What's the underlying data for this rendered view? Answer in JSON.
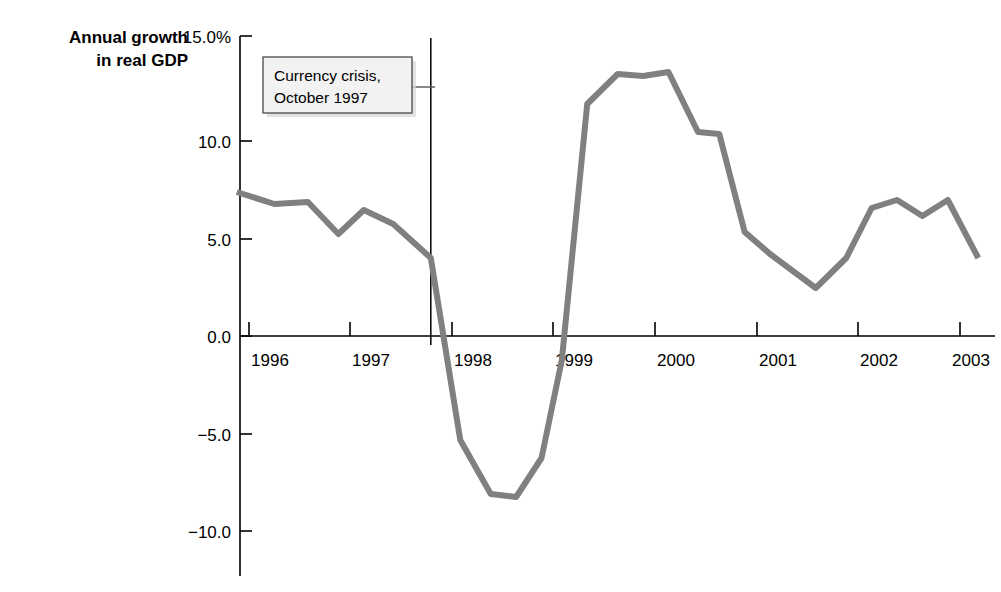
{
  "figure": {
    "axis_title": "Annual growth\nin real GDP",
    "line_color": "#808080",
    "axis_color": "#000000",
    "annotation_box_fill": "#f2f2f2",
    "annotation_box_border": "#555555",
    "background": "#ffffff"
  },
  "annotation": {
    "name": "currency-crisis-callout",
    "line1": "Currency crisis,",
    "line2": "October 1997",
    "marker_x_value": 1997.79
  },
  "chart_data": {
    "type": "line",
    "title": "Annual growth in real GDP",
    "xlabel": "",
    "ylabel": "Annual growth in real GDP",
    "xlim": [
      1995.85,
      1996.0
    ],
    "ylim": [
      -11.5,
      15.0
    ],
    "grid": false,
    "legend": null,
    "yticks": [
      15.0,
      10.0,
      5.0,
      0.0,
      -5.0,
      -10.0
    ],
    "ytick_labels": [
      "15.0%",
      "10.0",
      "5.0",
      "0.0",
      "−5.0",
      "−10.0"
    ],
    "xticks": [
      1996,
      1997,
      1998,
      1999,
      2000,
      2001,
      2002,
      2003
    ],
    "xtick_labels": [
      "1996",
      "1997",
      "1998",
      "1999",
      "2000",
      "2001",
      "2002",
      "2003"
    ],
    "x_axis_range": [
      1995.88,
      2003.25
    ],
    "series": [
      {
        "name": "Annual growth in real GDP",
        "color": "#808080",
        "x": [
          1995.88,
          1996.25,
          1996.58,
          1996.88,
          1997.13,
          1997.42,
          1997.79,
          1998.08,
          1998.38,
          1998.63,
          1998.88,
          1999.08,
          1999.33,
          1999.63,
          1999.88,
          2000.13,
          2000.42,
          2000.63,
          2000.88,
          2001.13,
          2001.58,
          2001.88,
          2002.13,
          2002.38,
          2002.63,
          2002.88,
          2003.18
        ],
        "y": [
          7.2,
          6.6,
          6.7,
          5.1,
          6.3,
          5.6,
          3.9,
          -5.2,
          -7.9,
          -8.05,
          -6.1,
          -1.2,
          11.6,
          13.1,
          13.0,
          13.2,
          10.2,
          10.1,
          5.2,
          4.1,
          2.4,
          3.9,
          6.4,
          6.8,
          6.0,
          6.8,
          3.9
        ]
      }
    ]
  }
}
